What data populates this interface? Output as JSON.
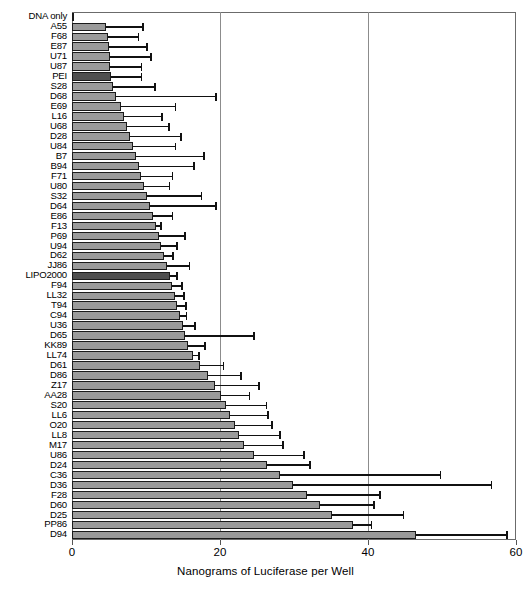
{
  "chart_data": {
    "type": "bar",
    "orientation": "horizontal",
    "title": "",
    "xlabel": "Nanograms of Luciferase per Well",
    "ylabel": "",
    "xlim": [
      0,
      60
    ],
    "ylim": null,
    "xticks": [
      0,
      20,
      40,
      60
    ],
    "xtick_labels": [
      "0",
      "20",
      "40",
      "60"
    ],
    "grid": "vertical gridlines at 20 and 40",
    "legend": null,
    "bar_fill_default": "#9a9a9a",
    "bar_fill_control_white": "#fdfdfd",
    "bar_fill_control_dark": "#4f4f4f",
    "bar_edge_color": "#1a1a1a",
    "error_bar_color": "#111111",
    "error_bars": "upper (one-sided) error bars shown",
    "categories": [
      "DNA only",
      "A55",
      "F68",
      "E87",
      "U71",
      "U87",
      "PEI",
      "S28",
      "D68",
      "E69",
      "L16",
      "U68",
      "D28",
      "U84",
      "B7",
      "B94",
      "F71",
      "U80",
      "S32",
      "D64",
      "E86",
      "F13",
      "P69",
      "U94",
      "D62",
      "JJ86",
      "LIPO2000",
      "F94",
      "LL32",
      "T94",
      "C94",
      "U36",
      "D65",
      "KK89",
      "LL74",
      "D61",
      "D86",
      "Z17",
      "AA28",
      "S20",
      "LL6",
      "O20",
      "LL8",
      "M17",
      "U86",
      "D24",
      "C36",
      "D36",
      "F28",
      "D60",
      "D25",
      "PP86",
      "D94"
    ],
    "values": [
      0.3,
      4.6,
      4.8,
      5.0,
      5.1,
      5.2,
      5.3,
      5.5,
      6.0,
      6.6,
      7.0,
      7.4,
      7.9,
      8.3,
      8.7,
      9.0,
      9.3,
      9.7,
      10.1,
      10.5,
      10.9,
      11.3,
      11.7,
      12.0,
      12.4,
      12.8,
      13.2,
      13.5,
      13.9,
      14.2,
      14.6,
      15.0,
      15.3,
      15.7,
      16.4,
      17.3,
      18.4,
      19.3,
      20.1,
      20.8,
      21.4,
      22.0,
      22.6,
      23.3,
      24.6,
      26.3,
      28.1,
      29.9,
      31.7,
      33.5,
      35.2,
      38.0,
      46.5
    ],
    "errors_upper": [
      0.0,
      9.6,
      9.0,
      10.2,
      10.7,
      9.4,
      9.4,
      11.2,
      19.5,
      14.0,
      12.2,
      13.1,
      14.7,
      14.0,
      17.9,
      16.5,
      13.6,
      13.2,
      17.5,
      19.5,
      13.6,
      12.0,
      15.3,
      14.2,
      13.7,
      15.9,
      14.2,
      14.9,
      15.1,
      15.4,
      15.5,
      16.6,
      24.6,
      18.0,
      17.2,
      20.5,
      22.8,
      25.3,
      24.0,
      26.3,
      26.5,
      27.0,
      28.1,
      28.5,
      31.4,
      32.2,
      49.8,
      56.7,
      41.6,
      40.8,
      44.8,
      40.5,
      58.8
    ],
    "bar_styles": [
      "white",
      "normal",
      "normal",
      "normal",
      "normal",
      "normal",
      "dark",
      "normal",
      "normal",
      "normal",
      "normal",
      "normal",
      "normal",
      "normal",
      "normal",
      "normal",
      "normal",
      "normal",
      "normal",
      "normal",
      "normal",
      "normal",
      "normal",
      "normal",
      "normal",
      "normal",
      "dark",
      "normal",
      "normal",
      "normal",
      "normal",
      "normal",
      "normal",
      "normal",
      "normal",
      "normal",
      "normal",
      "normal",
      "normal",
      "normal",
      "normal",
      "normal",
      "normal",
      "normal",
      "normal",
      "normal",
      "normal",
      "normal",
      "normal",
      "normal",
      "normal",
      "normal",
      "normal"
    ]
  }
}
